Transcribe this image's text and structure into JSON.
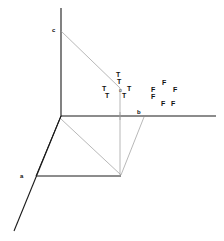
{
  "figure": {
    "background_color": "#ffffff",
    "line_color": "#1a1a1a",
    "faint_line_color": "#9a9a9a",
    "text_color": "#111111",
    "axes": [
      {
        "name": "vertical-axis",
        "label": "c",
        "label_x": 52,
        "label_y": 27,
        "x1": 61,
        "y1": 8,
        "x2": 61,
        "y2": 116
      },
      {
        "name": "horizontal-axis",
        "label": "b",
        "label_x": 137,
        "label_y": 109,
        "x1": 61,
        "y1": 116,
        "x2": 216,
        "y2": 116
      },
      {
        "name": "depth-axis",
        "label": "a",
        "label_x": 20,
        "label_y": 173,
        "x1": 61,
        "y1": 116,
        "x2": 14,
        "y2": 231
      }
    ],
    "origin_marker": {
      "label": "o",
      "x": 119,
      "y": 88
    },
    "solid_edges": [
      {
        "name": "floor-left-edge",
        "x1": 61,
        "y1": 116,
        "x2": 36,
        "y2": 176
      },
      {
        "name": "floor-front-edge",
        "x1": 36,
        "y1": 176,
        "x2": 121,
        "y2": 176
      }
    ],
    "faint_edges": [
      {
        "name": "c-to-origin-line",
        "x1": 61,
        "y1": 31,
        "x2": 120,
        "y2": 88
      },
      {
        "name": "origin-drop-line",
        "x1": 120,
        "y1": 88,
        "x2": 120,
        "y2": 176
      },
      {
        "name": "floor-diagonal",
        "x1": 61,
        "y1": 119,
        "x2": 121,
        "y2": 175
      },
      {
        "name": "b-to-corner-line",
        "x1": 144,
        "y1": 117,
        "x2": 121,
        "y2": 175
      },
      {
        "name": "axis-tick-mark",
        "x1": 120,
        "y1": 112,
        "x2": 120,
        "y2": 120
      }
    ],
    "truth_labels": [
      {
        "name": "t-label-1",
        "text": "T",
        "x": 116,
        "y": 71
      },
      {
        "name": "t-label-2",
        "text": "T",
        "x": 117,
        "y": 78
      },
      {
        "name": "t-label-3",
        "text": "T",
        "x": 102,
        "y": 85
      },
      {
        "name": "t-label-4",
        "text": "T",
        "x": 127,
        "y": 85
      },
      {
        "name": "t-label-5",
        "text": "T",
        "x": 105,
        "y": 92
      },
      {
        "name": "t-label-6",
        "text": "T",
        "x": 122,
        "y": 92
      }
    ],
    "false_labels": [
      {
        "name": "f-label-1",
        "text": "F",
        "x": 162,
        "y": 79
      },
      {
        "name": "f-label-2",
        "text": "F",
        "x": 151,
        "y": 86
      },
      {
        "name": "f-label-3",
        "text": "F",
        "x": 173,
        "y": 86
      },
      {
        "name": "f-label-4",
        "text": "F",
        "x": 151,
        "y": 93
      },
      {
        "name": "f-label-5",
        "text": "F",
        "x": 161,
        "y": 100
      },
      {
        "name": "f-label-6",
        "text": "F",
        "x": 171,
        "y": 100
      }
    ]
  }
}
